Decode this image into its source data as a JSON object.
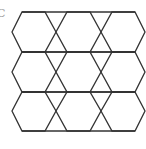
{
  "figure": {
    "label": "C",
    "stroke_color": "#333333",
    "background": "#ffffff",
    "rows": 3,
    "columns": 3
  },
  "geometry": {
    "row_tops": [
      12,
      52,
      92
    ],
    "row_mids": [
      32,
      72,
      111
    ],
    "row_bottoms": [
      52,
      92,
      131
    ],
    "hex_columns": [
      {
        "left": 12,
        "top_left": 22,
        "top_right": 45,
        "right": 56
      },
      {
        "left": 56,
        "top_left": 67,
        "top_right": 90,
        "right": 101
      },
      {
        "left": 101,
        "top_left": 112,
        "top_right": 135,
        "right": 145
      }
    ]
  }
}
